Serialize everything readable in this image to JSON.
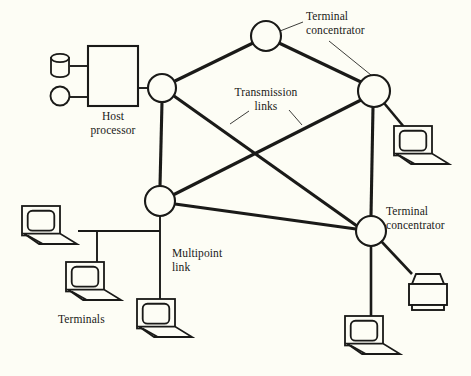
{
  "figure": {
    "type": "network-topology-diagram",
    "background_color": "#fdfdf5",
    "ink_color": "#1a1a18"
  },
  "labels": {
    "host_processor": "Host\nprocessor",
    "terminal_concentrator_top": "Terminal\nconcentrator",
    "terminal_concentrator_right": "Terminal\nconcentrator",
    "transmission_links": "Transmission\nlinks",
    "multipoint_link": "Multipoint\nlink",
    "terminals": "Terminals"
  },
  "nodes": [
    {
      "id": "n-host-gateway",
      "name": "host-gateway-node",
      "cx": 162,
      "cy": 88,
      "r": 14
    },
    {
      "id": "n-top",
      "name": "terminal-concentrator-top",
      "cx": 266,
      "cy": 36,
      "r": 15
    },
    {
      "id": "n-right-upper",
      "name": "terminal-concentrator-right-upper",
      "cx": 374,
      "cy": 91,
      "r": 16
    },
    {
      "id": "n-mid-left",
      "name": "terminal-concentrator-mid-left",
      "cx": 160,
      "cy": 201,
      "r": 15
    },
    {
      "id": "n-right-lower",
      "name": "terminal-concentrator-right-lower",
      "cx": 371,
      "cy": 231,
      "r": 15
    }
  ],
  "links": [
    {
      "name": "link-host-gateway-to-top",
      "from": "n-host-gateway",
      "to": "n-top",
      "kind": "transmission"
    },
    {
      "name": "link-top-to-right-upper",
      "from": "n-top",
      "to": "n-right-upper",
      "kind": "transmission"
    },
    {
      "name": "link-host-gateway-to-right-lower",
      "from": "n-host-gateway",
      "to": "n-right-lower",
      "kind": "transmission"
    },
    {
      "name": "link-mid-left-to-right-upper",
      "from": "n-mid-left",
      "to": "n-right-upper",
      "kind": "transmission"
    },
    {
      "name": "link-mid-left-to-right-lower",
      "from": "n-mid-left",
      "to": "n-right-lower",
      "kind": "transmission"
    },
    {
      "name": "link-right-upper-to-right-lower",
      "from": "n-right-upper",
      "to": "n-right-lower",
      "kind": "transmission"
    },
    {
      "name": "link-host-gateway-to-mid-left",
      "from": "n-host-gateway",
      "to": "n-mid-left",
      "kind": "transmission"
    }
  ],
  "devices": {
    "host_processor": {
      "name": "host-processor-box",
      "x": 88,
      "y": 46,
      "w": 50,
      "h": 60
    },
    "disk_drive": {
      "name": "disk-drive-icon",
      "cx": 60,
      "cy": 63
    },
    "tape_drive": {
      "name": "tape-drive-icon",
      "cx": 60,
      "cy": 96
    },
    "printer": {
      "name": "printer-icon",
      "x": 408,
      "y": 275
    },
    "terminals": [
      {
        "name": "terminal-icon-top-right",
        "x": 394,
        "y": 126
      },
      {
        "name": "terminal-icon-left-upper",
        "x": 22,
        "y": 206
      },
      {
        "name": "terminal-icon-left-lower",
        "x": 66,
        "y": 262
      },
      {
        "name": "terminal-icon-bottom-left",
        "x": 137,
        "y": 294
      },
      {
        "name": "terminal-icon-bottom-right",
        "x": 345,
        "y": 313
      }
    ]
  },
  "leader_lines": [
    {
      "name": "leader-terminal-concentrator-top",
      "x1": 281,
      "y1": 31,
      "x2": 303,
      "y2": 22
    },
    {
      "name": "leader-terminal-concentrator-right",
      "x1": 370,
      "y1": 76,
      "x2": 330,
      "y2": 41
    },
    {
      "name": "leader-transmission-links-left",
      "x1": 231,
      "y1": 123,
      "x2": 251,
      "y2": 112
    },
    {
      "name": "leader-transmission-links-right",
      "x1": 301,
      "y1": 124,
      "x2": 288,
      "y2": 110
    }
  ]
}
